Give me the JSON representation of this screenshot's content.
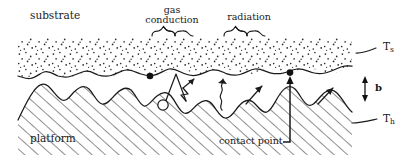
{
  "figure": {
    "kind": "cross-section-schematic",
    "title_visible": false,
    "line_color": "#1a1a1a",
    "background_color": "#ffffff"
  },
  "labels": {
    "substrate": "substrate",
    "platform": "platform",
    "gas_conduction_line1": "gas",
    "gas_conduction_line2": "conduction",
    "radiation": "radiation",
    "contact_point": "contact point",
    "temp_substrate_base": "T",
    "temp_substrate_sub": "s",
    "temp_heater_base": "T",
    "temp_heater_sub": "h",
    "gap_thickness": "b"
  },
  "regions": [
    {
      "name": "substrate",
      "fill_pattern": "stippled-dots",
      "label": "substrate",
      "temperature_label": "Ts",
      "y_top": 38,
      "y_bottom": 75
    },
    {
      "name": "platform",
      "fill_pattern": "diagonal-hatch",
      "label": "platform",
      "temperature_label": "Th",
      "y_top": 78,
      "y_bottom": 155
    },
    {
      "name": "interstitial-gap",
      "fill_pattern": "none",
      "label": "b",
      "description": "void between rough surfaces"
    }
  ],
  "annotations": [
    {
      "name": "gas-conduction",
      "label": "gas conduction",
      "marker": "brace",
      "brace_x": [
        152,
        193
      ]
    },
    {
      "name": "radiation",
      "label": "radiation",
      "marker": "brace",
      "brace_x": [
        224,
        265
      ]
    },
    {
      "name": "contact-point-left",
      "label": "contact point",
      "marker": "filled-dot",
      "x": 150,
      "y": 77
    },
    {
      "name": "contact-point-right",
      "label": "contact point",
      "marker": "filled-dot",
      "x": 290,
      "y": 73
    },
    {
      "name": "gap-dimension",
      "label": "b",
      "marker": "double-arrow",
      "x": 365
    },
    {
      "name": "substrate-temperature",
      "label": "Ts",
      "marker": "leader-line"
    },
    {
      "name": "platform-temperature",
      "label": "Th",
      "marker": "leader-line"
    }
  ]
}
